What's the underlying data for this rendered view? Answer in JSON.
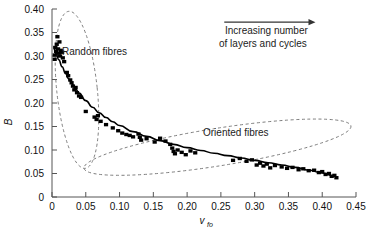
{
  "chart_data": {
    "type": "scatter",
    "title": "",
    "xlabel": "v_fo",
    "xlabel_base": "v",
    "xlabel_sub": "fo",
    "ylabel": "B",
    "xlim": [
      0,
      0.45
    ],
    "ylim": [
      0,
      0.4
    ],
    "grid": false,
    "legend_position": "none",
    "xticks": [
      0,
      0.05,
      0.1,
      0.15,
      0.2,
      0.25,
      0.3,
      0.35,
      0.4,
      0.45
    ],
    "xtick_labels": [
      "0",
      "0.05",
      "0.10",
      "0.15",
      "0.20",
      "0.25",
      "0.30",
      "0.35",
      "0.40",
      "0.45"
    ],
    "yticks": [
      0,
      0.05,
      0.1,
      0.15,
      0.2,
      0.25,
      0.3,
      0.35,
      0.4
    ],
    "ytick_labels": [
      "0",
      "0.05",
      "0.10",
      "0.15",
      "0.20",
      "0.25",
      "0.30",
      "0.35",
      "0.40"
    ],
    "marker_style": "filled-square",
    "marker_color": "#000000",
    "series": [
      {
        "name": "Measured B vs fibre volume fraction",
        "points": [
          [
            0.004,
            0.302
          ],
          [
            0.004,
            0.293
          ],
          [
            0.005,
            0.318
          ],
          [
            0.006,
            0.31
          ],
          [
            0.007,
            0.325
          ],
          [
            0.008,
            0.341
          ],
          [
            0.009,
            0.315
          ],
          [
            0.01,
            0.306
          ],
          [
            0.011,
            0.33
          ],
          [
            0.012,
            0.3
          ],
          [
            0.013,
            0.312
          ],
          [
            0.015,
            0.308
          ],
          [
            0.016,
            0.296
          ],
          [
            0.018,
            0.288
          ],
          [
            0.022,
            0.265
          ],
          [
            0.024,
            0.258
          ],
          [
            0.027,
            0.249
          ],
          [
            0.029,
            0.243
          ],
          [
            0.031,
            0.236
          ],
          [
            0.033,
            0.228
          ],
          [
            0.035,
            0.233
          ],
          [
            0.037,
            0.222
          ],
          [
            0.04,
            0.215
          ],
          [
            0.043,
            0.212
          ],
          [
            0.05,
            0.182
          ],
          [
            0.063,
            0.17
          ],
          [
            0.066,
            0.165
          ],
          [
            0.068,
            0.173
          ],
          [
            0.072,
            0.161
          ],
          [
            0.08,
            0.154
          ],
          [
            0.09,
            0.147
          ],
          [
            0.098,
            0.141
          ],
          [
            0.104,
            0.136
          ],
          [
            0.11,
            0.133
          ],
          [
            0.115,
            0.131
          ],
          [
            0.12,
            0.128
          ],
          [
            0.128,
            0.134
          ],
          [
            0.13,
            0.127
          ],
          [
            0.132,
            0.121
          ],
          [
            0.14,
            0.124
          ],
          [
            0.152,
            0.117
          ],
          [
            0.16,
            0.125
          ],
          [
            0.168,
            0.119
          ],
          [
            0.175,
            0.112
          ],
          [
            0.178,
            0.104
          ],
          [
            0.18,
            0.097
          ],
          [
            0.182,
            0.092
          ],
          [
            0.186,
            0.1
          ],
          [
            0.192,
            0.095
          ],
          [
            0.198,
            0.09
          ],
          [
            0.205,
            0.098
          ],
          [
            0.212,
            0.094
          ],
          [
            0.268,
            0.078
          ],
          [
            0.278,
            0.082
          ],
          [
            0.288,
            0.076
          ],
          [
            0.296,
            0.079
          ],
          [
            0.303,
            0.068
          ],
          [
            0.308,
            0.072
          ],
          [
            0.313,
            0.066
          ],
          [
            0.318,
            0.07
          ],
          [
            0.323,
            0.062
          ],
          [
            0.33,
            0.067
          ],
          [
            0.34,
            0.064
          ],
          [
            0.348,
            0.061
          ],
          [
            0.356,
            0.063
          ],
          [
            0.365,
            0.058
          ],
          [
            0.372,
            0.06
          ],
          [
            0.38,
            0.056
          ],
          [
            0.388,
            0.057
          ],
          [
            0.395,
            0.052
          ],
          [
            0.4,
            0.054
          ],
          [
            0.405,
            0.048
          ],
          [
            0.41,
            0.05
          ],
          [
            0.414,
            0.044
          ],
          [
            0.418,
            0.046
          ],
          [
            0.421,
            0.041
          ]
        ]
      }
    ],
    "fit_curve": {
      "name": "fitted trend line",
      "points": [
        [
          0.002,
          0.32
        ],
        [
          0.006,
          0.305
        ],
        [
          0.01,
          0.292
        ],
        [
          0.015,
          0.277
        ],
        [
          0.02,
          0.263
        ],
        [
          0.025,
          0.251
        ],
        [
          0.03,
          0.24
        ],
        [
          0.035,
          0.23
        ],
        [
          0.04,
          0.221
        ],
        [
          0.05,
          0.205
        ],
        [
          0.06,
          0.191
        ],
        [
          0.07,
          0.179
        ],
        [
          0.08,
          0.169
        ],
        [
          0.09,
          0.16
        ],
        [
          0.1,
          0.152
        ],
        [
          0.12,
          0.139
        ],
        [
          0.14,
          0.129
        ],
        [
          0.16,
          0.12
        ],
        [
          0.18,
          0.112
        ],
        [
          0.2,
          0.105
        ],
        [
          0.22,
          0.099
        ],
        [
          0.24,
          0.093
        ],
        [
          0.26,
          0.088
        ],
        [
          0.28,
          0.083
        ],
        [
          0.3,
          0.078
        ],
        [
          0.32,
          0.073
        ],
        [
          0.34,
          0.068
        ],
        [
          0.36,
          0.063
        ],
        [
          0.38,
          0.057
        ],
        [
          0.4,
          0.051
        ],
        [
          0.42,
          0.044
        ]
      ]
    },
    "annotations": [
      {
        "id": "random-fibres",
        "text": "Random fibres",
        "kind": "ellipse-label",
        "ellipse": {
          "cx": 0.037,
          "cy": 0.228,
          "rx": 0.03,
          "ry": 0.168,
          "rotation": -6
        }
      },
      {
        "id": "oriented-fibres",
        "text": "Oriented fibres",
        "kind": "ellipse-label",
        "ellipse": {
          "cx": 0.245,
          "cy": 0.106,
          "rx": 0.2,
          "ry": 0.04,
          "rotation": -9
        }
      },
      {
        "id": "increasing-layers",
        "text_line1": "Increasing number",
        "text_line2": "of layers and cycles",
        "kind": "arrow-note",
        "arrow_from": [
          0.255,
          0.372
        ],
        "arrow_to": [
          0.39,
          0.372
        ]
      }
    ]
  }
}
